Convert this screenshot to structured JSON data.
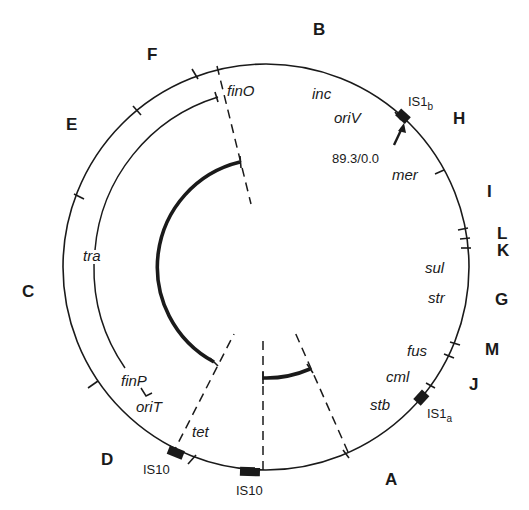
{
  "diagram": {
    "type": "plasmid restriction/genetic map",
    "center": [
      266,
      267
    ],
    "outer_radius": 203,
    "segments": [
      {
        "id": "A",
        "label": "A"
      },
      {
        "id": "B",
        "label": "B"
      },
      {
        "id": "C",
        "label": "C"
      },
      {
        "id": "D",
        "label": "D"
      },
      {
        "id": "E",
        "label": "E"
      },
      {
        "id": "F",
        "label": "F"
      },
      {
        "id": "G",
        "label": "G"
      },
      {
        "id": "H",
        "label": "H"
      },
      {
        "id": "I",
        "label": "I"
      },
      {
        "id": "J",
        "label": "J"
      },
      {
        "id": "K",
        "label": "K"
      },
      {
        "id": "L",
        "label": "L"
      },
      {
        "id": "M",
        "label": "M"
      }
    ],
    "genes": [
      {
        "id": "finO",
        "label": "finO"
      },
      {
        "id": "inc",
        "label": "inc"
      },
      {
        "id": "oriV",
        "label": "oriV"
      },
      {
        "id": "mer",
        "label": "mer"
      },
      {
        "id": "sul",
        "label": "sul"
      },
      {
        "id": "str",
        "label": "str"
      },
      {
        "id": "fus",
        "label": "fus"
      },
      {
        "id": "cml",
        "label": "cml"
      },
      {
        "id": "stb",
        "label": "stb"
      },
      {
        "id": "tet",
        "label": "tet"
      },
      {
        "id": "tra",
        "label": "tra"
      },
      {
        "id": "finP",
        "label": "finP"
      },
      {
        "id": "oriT",
        "label": "oriT"
      }
    ],
    "insertion_sequences": [
      {
        "id": "IS1b",
        "base": "IS1",
        "sub": "b"
      },
      {
        "id": "IS1a",
        "base": "IS1",
        "sub": "a"
      },
      {
        "id": "IS10_left",
        "label": "IS10"
      },
      {
        "id": "IS10_bottom",
        "label": "IS10"
      }
    ],
    "origin_marker": {
      "label": "89.3/0.0"
    }
  }
}
